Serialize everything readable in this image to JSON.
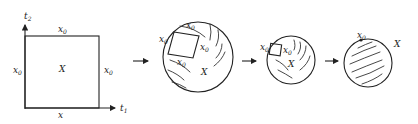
{
  "figure": {
    "panels": [
      {
        "id": "square",
        "axis_vertical_label": "t",
        "axis_vertical_sub": "2",
        "axis_horizontal_label": "t",
        "axis_horizontal_sub": "1",
        "top_edge_label": "x",
        "top_edge_sub": "0",
        "left_edge_label": "x",
        "left_edge_sub": "0",
        "right_edge_label": "x",
        "right_edge_sub": "0",
        "bottom_edge_label": "x",
        "center_label": "X"
      },
      {
        "id": "disc-large",
        "labels": [
          {
            "text": "x",
            "sub": "0"
          },
          {
            "text": "x",
            "sub": "0"
          },
          {
            "text": "x",
            "sub": "0"
          },
          {
            "text": "x",
            "sub": "0"
          }
        ],
        "center_label": "X"
      },
      {
        "id": "disc-medium",
        "labels": [
          {
            "text": "x",
            "sub": "0"
          },
          {
            "text": "x",
            "sub": "0"
          }
        ],
        "center_label": "X"
      },
      {
        "id": "sphere",
        "point_label": "x",
        "point_sub": "0",
        "outside_label": "X"
      }
    ],
    "arrows": [
      "→",
      "→",
      "→"
    ]
  }
}
